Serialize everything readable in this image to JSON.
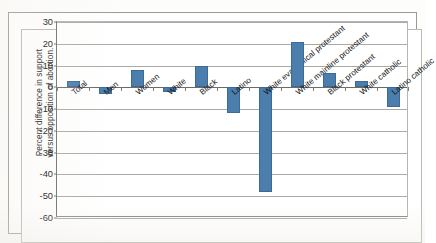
{
  "figure": {
    "axis_title_line1": "Percent difference in support",
    "axis_title_line2": "versus opposition of abortion.",
    "bar_color": "#4b7ead",
    "bar_border_color": "#3b6a96",
    "grid_color": "#a9a9a6",
    "axis_color": "#6f6f6c"
  },
  "chart_data": {
    "type": "bar",
    "title": "",
    "xlabel": "",
    "ylabel": "Percent difference in support versus opposition of abortion.",
    "ylim": [
      -60,
      30
    ],
    "ytick_labels": [
      "30",
      "20",
      "10",
      "0",
      "-10",
      "-20",
      "-30",
      "-40",
      "-50",
      "-60"
    ],
    "yticks": [
      30,
      20,
      10,
      0,
      -10,
      -20,
      -30,
      -40,
      -50,
      -60
    ],
    "grid": true,
    "legend": "none",
    "categories": [
      "Total",
      "Men",
      "Women",
      "White",
      "Black",
      "Latino",
      "White evangelical protestant",
      "White mainline protestant",
      "Black protestant",
      "White catholic",
      "Latino catholic"
    ],
    "values": [
      3,
      -3,
      8,
      -2,
      10,
      -12,
      -48,
      21,
      6.5,
      3,
      -9
    ]
  }
}
